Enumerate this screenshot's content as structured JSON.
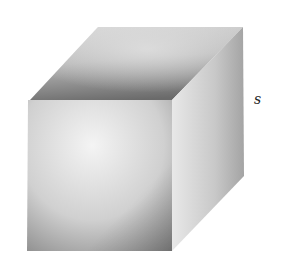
{
  "figure": {
    "type": "cube",
    "shading": "grayscale gradient",
    "side_label": "s",
    "colors": {
      "background": "#ffffff",
      "front_light": "#f2f2f2",
      "front_dark": "#8e8e8e",
      "top_light": "#cfcfcf",
      "top_dark": "#6e6e6e",
      "right_light": "#e6e6e6",
      "right_dark": "#a0a0a0"
    }
  }
}
